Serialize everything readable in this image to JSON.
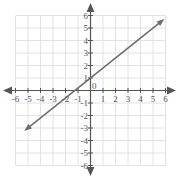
{
  "figure": {
    "kind": "coordinate-plane-line-graph",
    "background_color": "#ffffff",
    "grid_color": "#e2e2e6",
    "axis_color": "#555555",
    "line_color": "#6d6d6d",
    "label_color": "#555555"
  },
  "axes": {
    "x_tick_labels": [
      "-6",
      "-5",
      "-4",
      "-3",
      "-2",
      "-1",
      "1",
      "2",
      "3",
      "4",
      "5",
      "6"
    ],
    "y_tick_labels": [
      "6",
      "5",
      "4",
      "3",
      "2",
      "1",
      "-1",
      "-2",
      "-3",
      "-4",
      "-5",
      "-6"
    ],
    "origin_label": "0",
    "x_arrow_left": "arrow-left-icon",
    "x_arrow_right": "arrow-right-icon",
    "y_arrow_up": "arrow-up-icon",
    "y_arrow_down": "arrow-down-icon"
  },
  "chart_data": {
    "type": "line",
    "title": "",
    "xlabel": "",
    "ylabel": "",
    "xlim": [
      -6,
      6
    ],
    "ylim": [
      -6,
      6
    ],
    "x_ticks": [
      -6,
      -5,
      -4,
      -3,
      -2,
      -1,
      0,
      1,
      2,
      3,
      4,
      5,
      6
    ],
    "y_ticks": [
      -6,
      -5,
      -4,
      -3,
      -2,
      -1,
      0,
      1,
      2,
      3,
      4,
      5,
      6
    ],
    "grid": true,
    "legend": "none",
    "series": [
      {
        "name": "line",
        "equation": "y = 0.8x + 1",
        "slope": 0.8,
        "intercept": 1,
        "x_intercept": -1.25,
        "y_intercept": 1,
        "arrows": "both",
        "x": [
          -5.3,
          5.9
        ],
        "y": [
          -3.24,
          5.72
        ],
        "points": [
          {
            "x": -5.3,
            "y": -3.24
          },
          {
            "x": -1.25,
            "y": 0
          },
          {
            "x": 0,
            "y": 1
          },
          {
            "x": 5.9,
            "y": 5.72
          }
        ]
      }
    ]
  }
}
